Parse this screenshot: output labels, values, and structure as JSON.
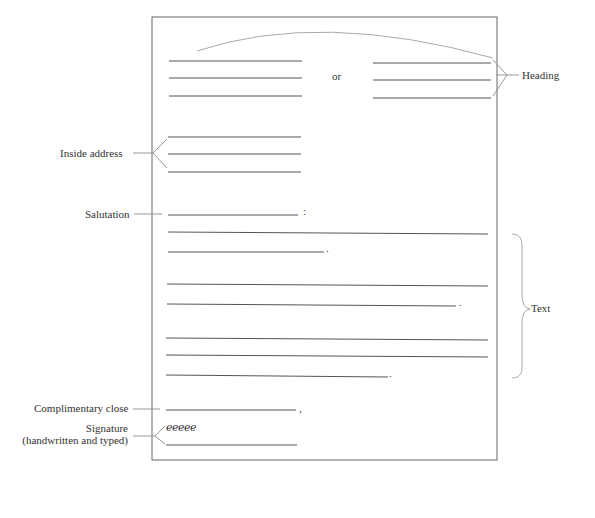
{
  "figure": {
    "labels": {
      "heading": "Heading",
      "inside_address": "Inside address",
      "salutation": "Salutation",
      "text": "Text",
      "complimentary_close": "Complimentary close",
      "signature_line1": "Signature",
      "signature_line2": "(handwritten and typed)"
    },
    "or_text": "or",
    "signature_script": "eeeee",
    "punctuation": {
      "salutation_colon": ":",
      "para1_period": ".",
      "para2_period": ".",
      "para3_period": ".",
      "close_comma": ","
    },
    "colors": {
      "page_border": "#666666",
      "rule_lines": "#555555",
      "leader_lines": "#999999",
      "text": "#333333"
    }
  }
}
